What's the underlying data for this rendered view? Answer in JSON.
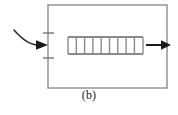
{
  "figure": {
    "caption": "(b)",
    "kind": "control-volume-schematic"
  },
  "colors": {
    "background": "#ffffff",
    "enclosure_stroke": "#8c8c97",
    "element_stroke": "#8a8a8a",
    "arrow_fill": "#1a1a1a",
    "curve_stroke": "#2b2b2b",
    "tick_stroke": "#6e6e6e",
    "caption_text": "#1a1a1a"
  },
  "enclosure": {
    "label": "control-volume-boundary",
    "x": 48,
    "y": 5,
    "width": 119,
    "height": 83,
    "stroke_width": 1.4
  },
  "inlet": {
    "label": "inlet-flow",
    "curve": {
      "start_x": 14,
      "start_y": 30,
      "control_x": 26,
      "control_y": 44,
      "end_x": 38,
      "end_y": 45
    },
    "arrow": {
      "tip_x": 48,
      "tip_y": 45,
      "tail_x": 37,
      "tail_y": 45,
      "half_height": 4.5
    }
  },
  "outlet": {
    "label": "outlet-flow",
    "arrow": {
      "tip_x": 171,
      "tip_y": 45,
      "tail_x": 146,
      "tail_y": 45,
      "shaft_width": 2.0,
      "head_length": 9,
      "half_height": 4.5
    }
  },
  "boundary_ticks": {
    "label": "boundary-port-ticks",
    "x_start": 43,
    "x_end": 54,
    "stroke_width": 1.3,
    "items": [
      {
        "name": "upper-tick",
        "y": 33
      },
      {
        "name": "lower-tick",
        "y": 58
      }
    ]
  },
  "element": {
    "label": "finned-element",
    "left_x": 68,
    "right_x": 143,
    "top_y": 37,
    "bottom_y": 54,
    "rail_stroke_width": 1.8,
    "rung_stroke_width": 1.4,
    "rung_count": 10,
    "rung_positions": [
      68,
      76.3,
      84.6,
      92.9,
      101.2,
      109.5,
      117.8,
      126.1,
      134.4,
      143
    ]
  }
}
